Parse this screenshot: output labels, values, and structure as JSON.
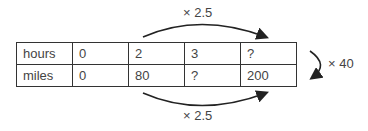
{
  "table": {
    "rows": [
      {
        "label": "hours",
        "values": [
          "0",
          "2",
          "3",
          "?"
        ]
      },
      {
        "label": "miles",
        "values": [
          "0",
          "80",
          "?",
          "200"
        ]
      }
    ]
  },
  "annotations": {
    "top_arrow": "× 2.5",
    "bottom_arrow": "× 2.5",
    "right_arrow": "× 40"
  }
}
